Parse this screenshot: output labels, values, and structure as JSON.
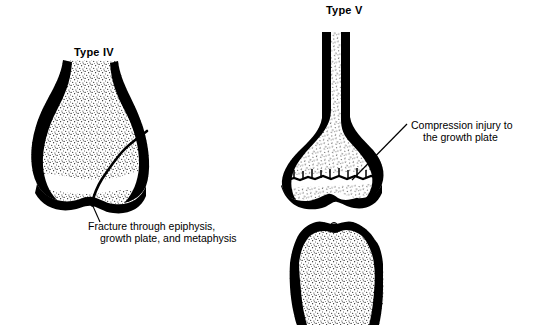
{
  "figure": {
    "background_color": "#ffffff",
    "ink_color": "#000000"
  },
  "panels": [
    {
      "id": "type-iv",
      "label": "Type IV",
      "caption_line1": "Fracture through epiphysis,",
      "caption_line2": "growth plate, and metaphysis",
      "bone": "distal femur"
    },
    {
      "id": "type-v",
      "label": "Type V",
      "caption_line1": "Compression injury to",
      "caption_line2": "the growth plate",
      "bone": "distal femur and proximal tibia at knee joint"
    }
  ]
}
